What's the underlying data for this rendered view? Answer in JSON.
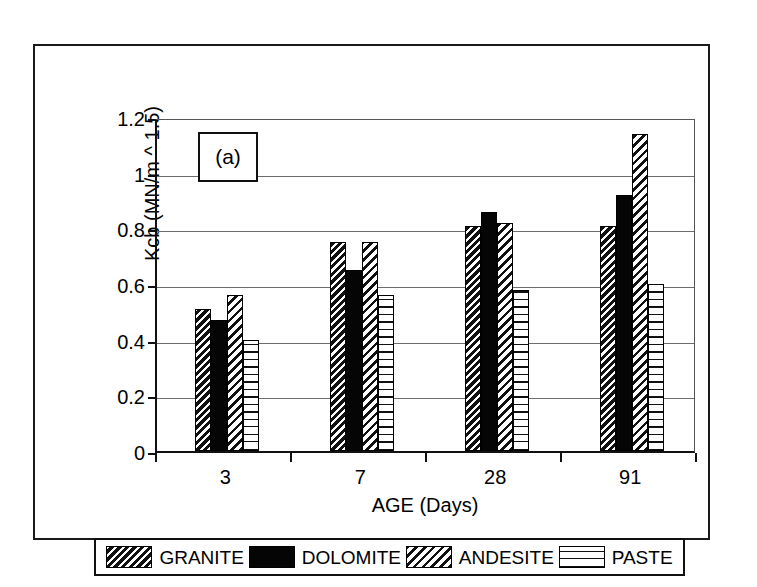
{
  "figure": {
    "panel_label": "(a)"
  },
  "chart_data": {
    "type": "bar",
    "title": "",
    "subtitle": "",
    "xlabel": "AGE (Days)",
    "ylabel": "Kcb (MN/m ^ 1.5)",
    "categories": [
      "3",
      "7",
      "28",
      "91"
    ],
    "series": [
      {
        "name": "GRANITE",
        "pattern": "diagonal-hatch-dark",
        "values": [
          0.51,
          0.75,
          0.81,
          0.81
        ]
      },
      {
        "name": "DOLOMITE",
        "pattern": "solid-black",
        "values": [
          0.47,
          0.65,
          0.86,
          0.92
        ]
      },
      {
        "name": "ANDESITE",
        "pattern": "diagonal-hatch-light",
        "values": [
          0.56,
          0.75,
          0.82,
          1.14
        ]
      },
      {
        "name": "PASTE",
        "pattern": "grid-crosshatch",
        "values": [
          0.4,
          0.56,
          0.58,
          0.6
        ]
      }
    ],
    "ylim": [
      0,
      1.2
    ],
    "yticks": [
      "0",
      "0.2",
      "0.4",
      "0.6",
      "0.8",
      "1",
      "1.2"
    ],
    "ytick_values": [
      0,
      0.2,
      0.4,
      0.6,
      0.8,
      1,
      1.2
    ],
    "grid": "horizontal",
    "legend_position": "bottom",
    "annotations": [
      "(a)"
    ]
  },
  "colors": {
    "axis": "#111111",
    "grid": "#6d6d6d",
    "bar_outline": "#000000",
    "background": "#ffffff"
  }
}
